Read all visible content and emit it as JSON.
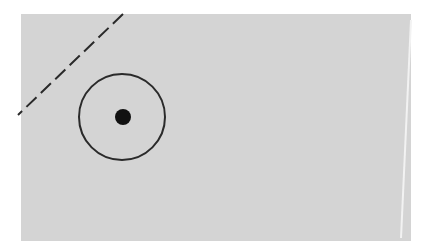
{
  "figure": {
    "background": "#ffffff",
    "panel": {
      "x": 21,
      "y": 14,
      "width": 390,
      "height": 227,
      "fill": "#d4d4d4"
    },
    "edge_line": {
      "x1": 411,
      "y1": 20,
      "x2": 401,
      "y2": 238,
      "color": "#f2f2f2"
    },
    "dashed_line": {
      "x1": 123,
      "y1": 14,
      "x2": 18,
      "y2": 115,
      "color": "#2a2a2a",
      "dash": "14 6"
    },
    "ring": {
      "cx": 122,
      "cy": 117,
      "r": 43,
      "color": "#2a2a2a",
      "stroke_width": 2
    },
    "dot": {
      "cx": 123,
      "cy": 117,
      "r": 8,
      "color": "#111111"
    }
  }
}
